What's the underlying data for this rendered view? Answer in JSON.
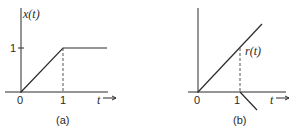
{
  "panels": [
    {
      "id": "a",
      "caption": "(a)",
      "y_label": "x(t)",
      "x_label": "t",
      "origin_label": "0",
      "x_tick_label": "1",
      "y_tick_label": "1",
      "description": "x(t) rises linearly from 0 at t=0 to 1 at t=1, then stays constant at 1"
    },
    {
      "id": "b",
      "caption": "(b)",
      "curve_label": "r(t)",
      "x_label": "t",
      "origin_label": "0",
      "x_tick_label": "1",
      "description": "ramp r(t) rising from origin with slope 1, and a negative ramp starting at t=1 going downward"
    }
  ],
  "colors": {
    "line": "#2a2a2a",
    "dashed": "#555555",
    "background": "#ffffff"
  }
}
